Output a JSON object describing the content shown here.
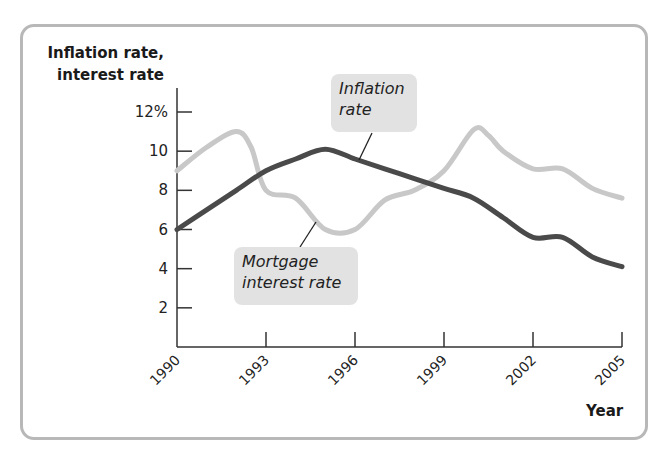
{
  "chart_data": {
    "type": "line",
    "title": "",
    "xlabel": "Year",
    "ylabel": "Inflation rate, interest rate",
    "x_ticks": [
      "1990",
      "1993",
      "1996",
      "1999",
      "2002",
      "2005"
    ],
    "y_ticks": [
      "2",
      "4",
      "6",
      "8",
      "10",
      "12%"
    ],
    "xlim": [
      1990,
      2005
    ],
    "ylim": [
      0,
      12
    ],
    "grid": false,
    "legend": "callout labels",
    "series": [
      {
        "name": "Inflation rate",
        "color": "#4a4a4a",
        "x": [
          1990,
          1991,
          1992,
          1993,
          1994,
          1995,
          1996,
          1997,
          1998,
          1999,
          2000,
          2001,
          2002,
          2003,
          2004,
          2005
        ],
        "values": [
          6.0,
          7.0,
          8.0,
          9.0,
          9.6,
          10.1,
          9.6,
          9.1,
          8.6,
          8.1,
          7.6,
          6.6,
          5.6,
          5.6,
          4.6,
          4.1
        ]
      },
      {
        "name": "Mortgage interest rate",
        "color": "#c8c8c8",
        "x": [
          1990,
          1991,
          1992,
          1992.5,
          1993,
          1994,
          1995,
          1996,
          1997,
          1998,
          1999,
          2000,
          2000.5,
          2001,
          2002,
          2003,
          2004,
          2005
        ],
        "values": [
          9.0,
          10.2,
          11.0,
          10.2,
          8.0,
          7.6,
          6.0,
          6.0,
          7.5,
          8.0,
          9.0,
          11.1,
          10.8,
          10.0,
          9.1,
          9.1,
          8.1,
          7.6
        ]
      }
    ],
    "annotations": [
      "Inflation rate",
      "Mortgage interest rate"
    ]
  },
  "labels": {
    "ylabel_line1": "Inflation rate,",
    "ylabel_line2": "interest rate",
    "xlabel": "Year",
    "callout_inflation_1": "Inflation",
    "callout_inflation_2": "rate",
    "callout_mortgage_1": "Mortgage",
    "callout_mortgage_2": "interest rate"
  }
}
